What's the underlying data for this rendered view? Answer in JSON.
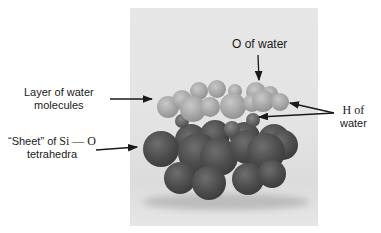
{
  "figure": {
    "photo": {
      "x": 130,
      "y": 8,
      "w": 188,
      "h": 218
    },
    "labels": {
      "o_of_water": "O of water",
      "layer_line1": "Layer of water",
      "layer_line2": "molecules",
      "sheet_line1": "“Sheet” of ",
      "sheet_si_o": "Si — O",
      "sheet_line2": "tetrahedra",
      "h_line1": "H of",
      "h_line2": "water"
    },
    "colors": {
      "background": "#ffffff",
      "photo_bg": "#e4e4e4",
      "arrow": "#1a1a1a",
      "water_sphere": "#a8a8a8",
      "si_o_sphere": "#4e4e4e"
    },
    "spheres": {
      "si_o_back": [
        {
          "x": 175,
          "y": 124,
          "d": 32
        },
        {
          "x": 200,
          "y": 120,
          "d": 30
        },
        {
          "x": 230,
          "y": 122,
          "d": 30
        },
        {
          "x": 258,
          "y": 124,
          "d": 32
        },
        {
          "x": 268,
          "y": 130,
          "d": 30
        }
      ],
      "si_o_front": [
        {
          "x": 143,
          "y": 131,
          "d": 36
        },
        {
          "x": 178,
          "y": 133,
          "d": 40
        },
        {
          "x": 200,
          "y": 138,
          "d": 38
        },
        {
          "x": 230,
          "y": 130,
          "d": 34
        },
        {
          "x": 247,
          "y": 133,
          "d": 38
        },
        {
          "x": 164,
          "y": 162,
          "d": 32
        },
        {
          "x": 192,
          "y": 166,
          "d": 34
        },
        {
          "x": 232,
          "y": 163,
          "d": 32
        },
        {
          "x": 258,
          "y": 160,
          "d": 28
        }
      ],
      "h_of_water": [
        {
          "x": 175,
          "y": 114,
          "d": 14
        },
        {
          "x": 246,
          "y": 113,
          "d": 14
        },
        {
          "x": 224,
          "y": 121,
          "d": 16
        }
      ],
      "water": [
        {
          "x": 190,
          "y": 82,
          "d": 18
        },
        {
          "x": 208,
          "y": 80,
          "d": 18
        },
        {
          "x": 228,
          "y": 84,
          "d": 14
        },
        {
          "x": 246,
          "y": 82,
          "d": 20
        },
        {
          "x": 262,
          "y": 86,
          "d": 16
        },
        {
          "x": 157,
          "y": 96,
          "d": 22
        },
        {
          "x": 172,
          "y": 90,
          "d": 20
        },
        {
          "x": 180,
          "y": 96,
          "d": 26
        },
        {
          "x": 200,
          "y": 97,
          "d": 20
        },
        {
          "x": 220,
          "y": 93,
          "d": 26
        },
        {
          "x": 243,
          "y": 94,
          "d": 18
        },
        {
          "x": 252,
          "y": 90,
          "d": 22
        },
        {
          "x": 271,
          "y": 93,
          "d": 18
        }
      ]
    }
  }
}
